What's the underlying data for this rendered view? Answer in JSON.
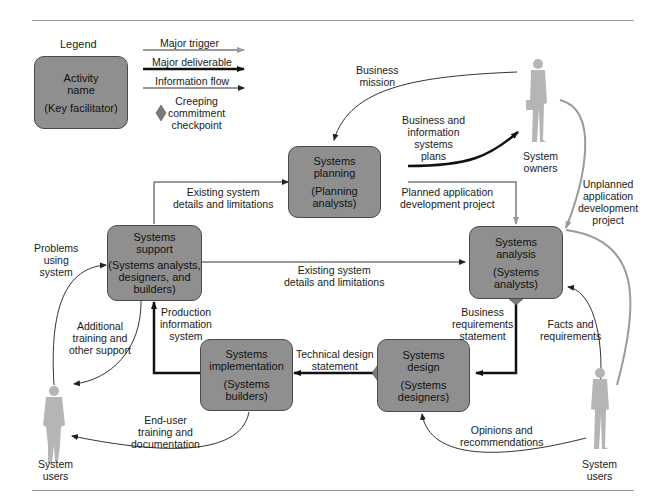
{
  "legend": {
    "title": "Legend",
    "box_name": "Activity\nname",
    "box_facilitator": "(Key facilitator)",
    "major_trigger": "Major trigger",
    "major_deliverable": "Major deliverable",
    "information_flow": "Information flow",
    "checkpoint": "Creeping\ncommitment\ncheckpoint"
  },
  "activities": {
    "planning": {
      "name": "Systems\nplanning",
      "facilitator": "(Planning\nanalysts)"
    },
    "analysis": {
      "name": "Systems\nanalysis",
      "facilitator": "(Systems\nanalysts)"
    },
    "design": {
      "name": "Systems\ndesign",
      "facilitator": "(Systems\ndesigners)"
    },
    "implementation": {
      "name": "Systems\nimplementation",
      "facilitator": "(Systems\nbuilders)"
    },
    "support": {
      "name": "Systems\nsupport",
      "facilitator": "(Systems analysts,\ndesigners, and\nbuilders)"
    }
  },
  "actors": {
    "owners": "System\nowners",
    "users_left": "System\nusers",
    "users_right": "System\nusers"
  },
  "flows": {
    "business_mission": "Business\nmission",
    "bis_plans": "Business and\ninformation\nsystems\nplans",
    "existing_top": "Existing system\ndetails and limitations",
    "planned_project": "Planned application\ndevelopment project",
    "unplanned_project": "Unplanned\napplication\ndevelopment\nproject",
    "existing_mid": "Existing system\ndetails and limitations",
    "business_requirements": "Business\nrequirements\nstatement",
    "facts_requirements": "Facts and\nrequirements",
    "technical_design": "Technical design\nstatement",
    "production_system": "Production\ninformation\nsystem",
    "problems_using": "Problems\nusing\nsystem",
    "additional_training": "Additional\ntraining and\nother support",
    "enduser_training": "End-user\ntraining and\ndocumentation",
    "opinions": "Opinions and\nrecommendations"
  },
  "colors": {
    "box_fill": "#8f8f8f",
    "trigger": "#9a9a9a",
    "deliverable": "#111111",
    "info": "#333333",
    "figure": "#b5b5b5",
    "checkpoint": "#7a7a7a"
  }
}
